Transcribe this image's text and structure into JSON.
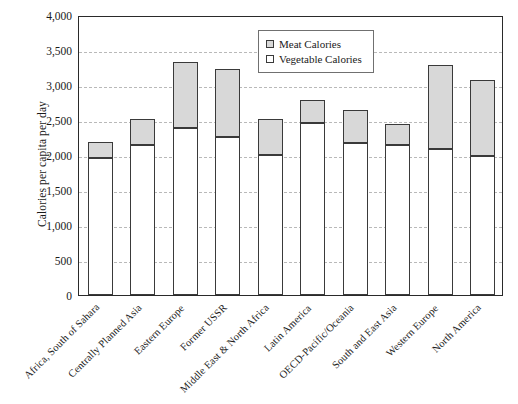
{
  "chart_data": {
    "type": "bar",
    "stacked": true,
    "title": "",
    "xlabel": "",
    "ylabel": "Calories per capita per day",
    "ylim": [
      0,
      4000
    ],
    "ytick_step": 500,
    "ytick_labels": [
      "4,000",
      "3,500",
      "3,000",
      "2,500",
      "2,000",
      "1,500",
      "1,000",
      "500",
      "0"
    ],
    "ytick_values": [
      4000,
      3500,
      3000,
      2500,
      2000,
      1500,
      1000,
      500,
      0
    ],
    "grid": true,
    "grid_style": "dashed horizontal",
    "legend_position": "top-center",
    "categories": [
      "Africa, South of Sahara",
      "Centrally Planned Asia",
      "Eastern Europe",
      "Former USSR",
      "Middle East & North Africa",
      "Latin America",
      "OECD-Pacific/Oceania",
      "South and East Asia",
      "Western Europe",
      "North America"
    ],
    "series": [
      {
        "name": "Vegetable Calories",
        "color": "#ffffff",
        "values": [
          1960,
          2140,
          2380,
          2260,
          2000,
          2460,
          2170,
          2150,
          2090,
          1990
        ]
      },
      {
        "name": "Meat Calories",
        "color": "#d8d8d8",
        "values": [
          220,
          380,
          950,
          970,
          520,
          320,
          470,
          300,
          1200,
          1080
        ]
      }
    ],
    "totals": [
      2180,
      2520,
      3330,
      3230,
      2520,
      2780,
      2640,
      2450,
      3290,
      3070
    ]
  },
  "legend": {
    "items": [
      {
        "label": "Meat Calories",
        "swatch": "filled-gray-square-icon"
      },
      {
        "label": "Vegetable Calories",
        "swatch": "white-square-icon"
      }
    ]
  },
  "colors": {
    "meat": "#d8d8d8",
    "vegetable": "#ffffff",
    "bar_border": "#3a3a3a",
    "axis": "#2a2a2a",
    "grid": "#b9b9b9",
    "text": "#1a1a1a"
  }
}
